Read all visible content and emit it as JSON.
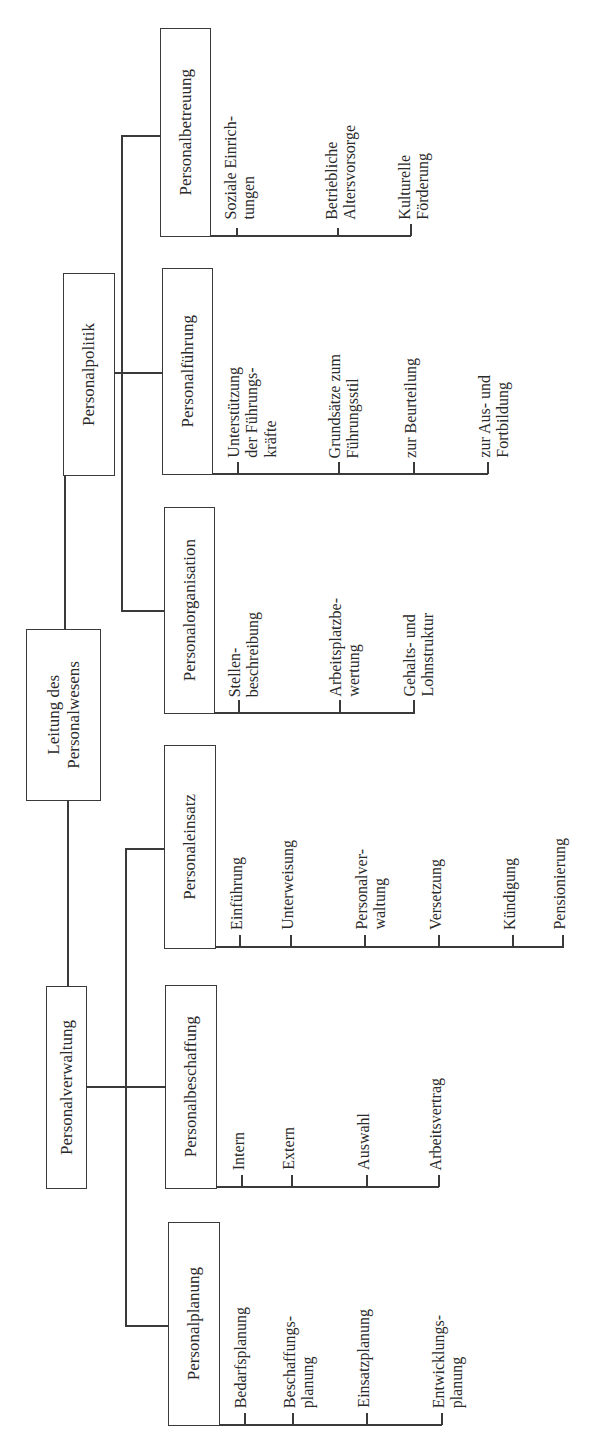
{
  "diagram": {
    "type": "org-chart",
    "orientation": "rotated-90-ccw",
    "root": {
      "label_line1": "Leitung des",
      "label_line2": "Personalwesens"
    },
    "branches": [
      {
        "label": "Personalpolitik",
        "children": [
          {
            "label": "Personalbetreuung",
            "leaves": [
              {
                "line1": "Soziale Einrich-",
                "line2": "tungen"
              },
              {
                "line1": "Betriebliche",
                "line2": "Altersvorsorge"
              },
              {
                "line1": "Kulturelle",
                "line2": "Förderung"
              }
            ]
          },
          {
            "label": "Personalführung",
            "leaves": [
              {
                "line1": "Unterstützung",
                "line2": "der Führungs-",
                "line3": "kräfte"
              },
              {
                "line1": "Grundsätze zum",
                "line2": "Führungsstil"
              },
              {
                "line1": "zur Beurteilung"
              },
              {
                "line1": "zur Aus- und",
                "line2": "Fortbildung"
              }
            ]
          },
          {
            "label": "Personalorganisation",
            "leaves": [
              {
                "line1": "Stellen-",
                "line2": "beschreibung"
              },
              {
                "line1": "Arbeitsplatzbe-",
                "line2": "wertung"
              },
              {
                "line1": "Gehalts- und",
                "line2": "Lohnstruktur"
              }
            ]
          }
        ]
      },
      {
        "label": "Personalverwaltung",
        "children": [
          {
            "label": "Personaleinsatz",
            "leaves": [
              {
                "line1": "Einführung"
              },
              {
                "line1": "Unterweisung"
              },
              {
                "line1": "Personalver-",
                "line2": "waltung"
              },
              {
                "line1": "Versetzung"
              },
              {
                "line1": "Kündigung"
              },
              {
                "line1": "Pensionierung"
              }
            ]
          },
          {
            "label": "Personalbeschaffung",
            "leaves": [
              {
                "line1": "Intern"
              },
              {
                "line1": "Extern"
              },
              {
                "line1": "Auswahl"
              },
              {
                "line1": "Arbeitsvertrag"
              }
            ]
          },
          {
            "label": "Personalplanung",
            "leaves": [
              {
                "line1": "Bedarfsplanung"
              },
              {
                "line1": "Beschaffungs-",
                "line2": "planung"
              },
              {
                "line1": "Einsatzplanung"
              },
              {
                "line1": "Entwicklungs-",
                "line2": "planung"
              }
            ]
          }
        ]
      }
    ],
    "colors": {
      "line": "#3a3a3a",
      "text": "#2a2a2a",
      "background": "#ffffff"
    }
  }
}
